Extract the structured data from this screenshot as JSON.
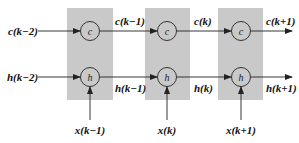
{
  "diagram": {
    "type": "unrolled-lstm-cell-chain",
    "colors": {
      "cell_box": "#c9c9c9",
      "line": "#222222",
      "background": "#ffffff"
    },
    "cells": [
      {
        "c_node": "c",
        "h_node": "h",
        "input_label": "x(k−1)"
      },
      {
        "c_node": "c",
        "h_node": "h",
        "input_label": "x(k)"
      },
      {
        "c_node": "c",
        "h_node": "h",
        "input_label": "x(k+1)"
      }
    ],
    "c_labels": [
      "c(k−2)",
      "c(k−1)",
      "c(k)",
      "c(k+1)"
    ],
    "h_labels": [
      "h(k−2)",
      "h(k−1)",
      "h(k)",
      "h(k+1)"
    ]
  }
}
